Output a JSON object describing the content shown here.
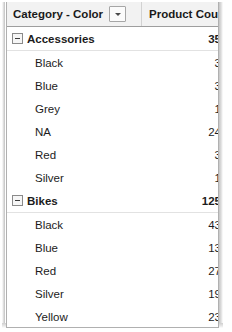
{
  "table": {
    "columns": [
      {
        "id": "category_color",
        "label": "Category - Color",
        "filter_icon": "chevron-down-icon"
      },
      {
        "id": "product_count",
        "label": "Product Count"
      }
    ],
    "rows": [
      {
        "type": "group",
        "label": "Accessories",
        "value": "35",
        "state_icon": "collapse-minus-icon"
      },
      {
        "type": "child",
        "label": "Black",
        "value": "3"
      },
      {
        "type": "child",
        "label": "Blue",
        "value": "3"
      },
      {
        "type": "child",
        "label": "Grey",
        "value": "1"
      },
      {
        "type": "child",
        "label": "NA",
        "value": "24"
      },
      {
        "type": "child",
        "label": "Red",
        "value": "3"
      },
      {
        "type": "child",
        "label": "Silver",
        "value": "1"
      },
      {
        "type": "group",
        "label": "Bikes",
        "value": "125",
        "state_icon": "collapse-minus-icon"
      },
      {
        "type": "child",
        "label": "Black",
        "value": "43"
      },
      {
        "type": "child",
        "label": "Blue",
        "value": "13"
      },
      {
        "type": "child",
        "label": "Red",
        "value": "27"
      },
      {
        "type": "child",
        "label": "Silver",
        "value": "19"
      },
      {
        "type": "child",
        "label": "Yellow",
        "value": "23"
      },
      {
        "type": "group",
        "label": "Clothing",
        "value": "48",
        "state_icon": "collapse-minus-icon"
      },
      {
        "type": "child",
        "label": "Black",
        "value": "19"
      },
      {
        "type": "child",
        "label": "Blue",
        "value": "3"
      }
    ]
  },
  "colors": {
    "header_background": "#f2f2f2",
    "header_text": "#1a1a1a",
    "body_text": "#1c1c1c",
    "grid_border": "#b0b0b0"
  }
}
